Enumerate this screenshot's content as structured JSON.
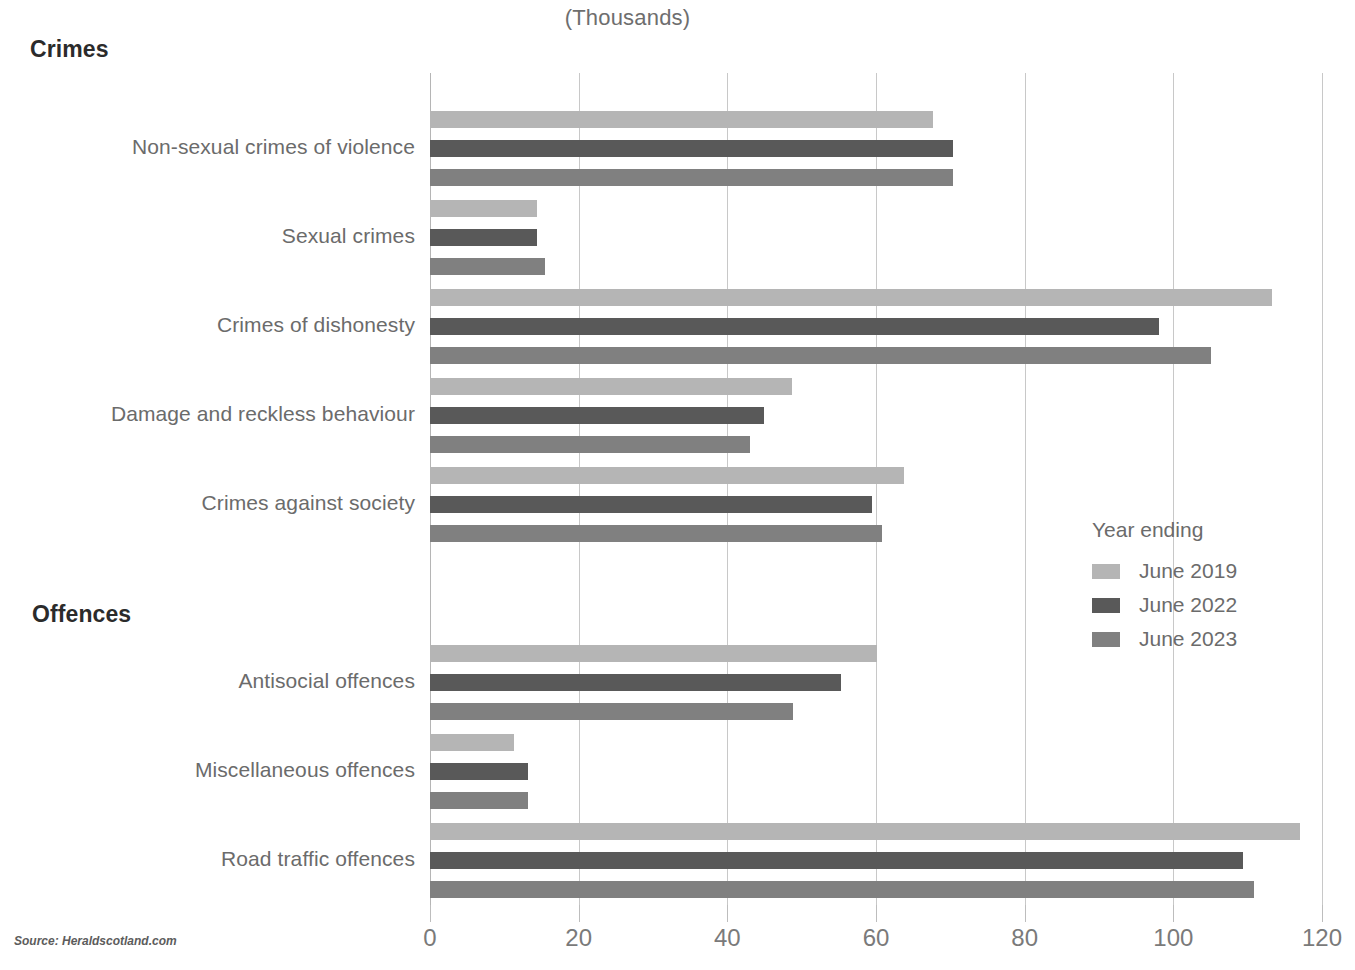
{
  "header": {
    "unit_title": "(Thousands)",
    "section_crimes": "Crimes",
    "section_offences": "Offences"
  },
  "legend": {
    "title": "Year ending",
    "entries": [
      {
        "label": "June 2019",
        "color": "#b5b5b5"
      },
      {
        "label": "June 2022",
        "color": "#595959"
      },
      {
        "label": "June 2023",
        "color": "#808080"
      }
    ]
  },
  "source": {
    "text": "Source: Heraldscotland.com"
  },
  "colors": {
    "series_2019": "#b5b5b5",
    "series_2022": "#595959",
    "series_2023": "#808080",
    "gridline": "#c8c8c8",
    "label_text": "#6b6b6b",
    "heading_text": "#2b2b2b"
  },
  "chart_data": {
    "type": "bar",
    "orientation": "horizontal",
    "title": "(Thousands)",
    "xlabel": "",
    "ylabel": "",
    "xlim": [
      0,
      120
    ],
    "xticks": [
      0,
      20,
      40,
      60,
      80,
      100,
      120
    ],
    "xtick_labels": [
      "0",
      "20",
      "40",
      "60",
      "80",
      "100",
      "120"
    ],
    "grid": "vertical",
    "legend_position": "right-middle",
    "legend_title": "Year ending",
    "groups": [
      {
        "name": "Crimes",
        "categories": [
          "Non-sexual crimes of violence",
          "Sexual crimes",
          "Crimes of dishonesty",
          "Damage and reckless behaviour",
          "Crimes against society"
        ]
      },
      {
        "name": "Offences",
        "categories": [
          "Antisocial offences",
          "Miscellaneous offences",
          "Road traffic offences"
        ]
      }
    ],
    "categories": [
      "Non-sexual crimes of violence",
      "Sexual crimes",
      "Crimes of dishonesty",
      "Damage and reckless behaviour",
      "Crimes against society",
      "Antisocial offences",
      "Miscellaneous offences",
      "Road traffic offences"
    ],
    "series": [
      {
        "name": "June 2019",
        "color": "#b5b5b5",
        "values": [
          67.7,
          14.4,
          113.3,
          48.7,
          63.7,
          60.2,
          11.3,
          117.1
        ]
      },
      {
        "name": "June 2022",
        "color": "#595959",
        "values": [
          70.4,
          14.4,
          98.1,
          44.9,
          59.4,
          55.3,
          13.2,
          109.4
        ]
      },
      {
        "name": "June 2023",
        "color": "#808080",
        "values": [
          70.3,
          15.5,
          105.0,
          43.0,
          60.8,
          48.8,
          13.2,
          110.9
        ]
      }
    ]
  },
  "layout": {
    "plot_left": 430,
    "plot_top": 73,
    "plot_width": 892,
    "plot_height": 832,
    "bar_height": 17,
    "bar_pitch": 29,
    "group_tops": [
      111,
      200,
      289,
      378,
      467,
      645,
      734,
      823
    ]
  }
}
